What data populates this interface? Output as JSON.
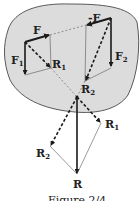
{
  "figure": {
    "caption": "Figure 2/4",
    "colors": {
      "body_fill": "#dcdcdc",
      "body_stroke": "#333333",
      "vector": "#1a1a1a",
      "construction": "#555555"
    },
    "labels": {
      "F": "F",
      "neg_F": "-F",
      "F1": "F",
      "F1_sub": "1",
      "F2": "F",
      "F2_sub": "2",
      "R1_upper": "R",
      "R1_upper_sub": "1",
      "R2_upper": "R",
      "R2_upper_sub": "2",
      "R1_lower": "R",
      "R1_lower_sub": "1",
      "R2_lower": "R",
      "R2_lower_sub": "2",
      "R": "R"
    }
  }
}
